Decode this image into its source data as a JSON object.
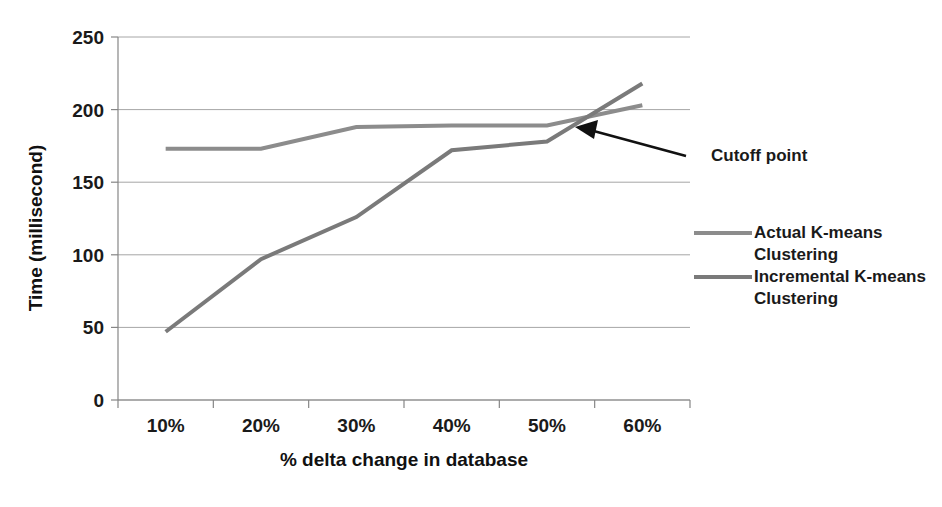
{
  "chart_data": {
    "type": "line",
    "title": "",
    "xlabel": "% delta change in database",
    "ylabel": "Time (millisecond)",
    "categories": [
      "10%",
      "20%",
      "30%",
      "40%",
      "50%",
      "60%"
    ],
    "x": [
      10,
      20,
      30,
      40,
      50,
      60
    ],
    "xlim": [
      5,
      65
    ],
    "ylim": [
      0,
      250
    ],
    "yticks": [
      0,
      50,
      100,
      150,
      200,
      250
    ],
    "ytick_labels": [
      "0",
      "50",
      "100",
      "150",
      "200",
      "250"
    ],
    "grid": "horizontal",
    "legend_position": "right",
    "series": [
      {
        "name": "Actual K-means Clustering",
        "color": "#8c8c8c",
        "values": [
          173,
          173,
          188,
          189,
          189,
          203
        ]
      },
      {
        "name": "Incremental K-means Clustering",
        "color": "#7a7a7a",
        "values": [
          47,
          97,
          126,
          172,
          178,
          218
        ]
      }
    ],
    "annotations": [
      {
        "text": "Cutoff point",
        "target_x": 53,
        "target_y": 190,
        "note": "arrow pointing at intersection of the two series"
      }
    ]
  },
  "axes": {
    "y_axis_title": "Time (millisecond)",
    "x_axis_title": "% delta change in database",
    "y_tick_labels": [
      "250",
      "200",
      "150",
      "100",
      "50",
      "0"
    ],
    "x_tick_labels": [
      "10%",
      "20%",
      "30%",
      "40%",
      "50%",
      "60%"
    ]
  },
  "legend": {
    "items": [
      {
        "label_line1": "Actual K-means",
        "label_line2": "Clustering",
        "color": "#8c8c8c"
      },
      {
        "label_line1": "Incremental K-means",
        "label_line2": "Clustering",
        "color": "#7a7a7a"
      }
    ]
  },
  "annotation": {
    "cutoff_label": "Cutoff point"
  }
}
